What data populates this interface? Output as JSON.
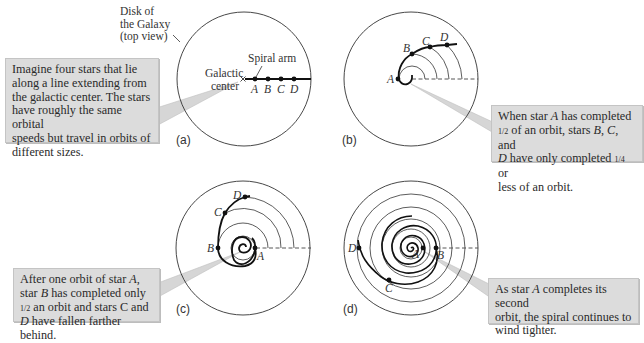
{
  "annotations": {
    "disk_label": [
      "Disk of",
      "the Galaxy",
      "(top view)"
    ],
    "spiral_arm": "Spiral arm",
    "galactic_center": [
      "Galactic",
      "center"
    ]
  },
  "panels": [
    {
      "id": "a",
      "label": "(a)",
      "stars": [
        "A",
        "B",
        "C",
        "D"
      ],
      "callout": {
        "lines": [
          "Imagine four stars that lie",
          "along a line extending from",
          "the galactic center. The stars",
          "have roughly the same orbital",
          "speeds but travel in orbits of",
          "different sizes."
        ]
      }
    },
    {
      "id": "b",
      "label": "(b)",
      "stars": [
        "A",
        "B",
        "C",
        "D"
      ],
      "callout": {
        "parts": {
          "l1_pre": "When star ",
          "l1_em": "A",
          "l1_post": " has completed",
          "l2_frac": "1/2",
          "l2_mid": " of an orbit, stars ",
          "l2_em1": "B",
          "l2_sep": ", ",
          "l2_em2": "C",
          "l2_post": ", and",
          "l3_em": "D",
          "l3_mid": " have only completed ",
          "l3_frac": "1/4",
          "l3_post": " or",
          "l4": "less of an orbit."
        }
      }
    },
    {
      "id": "c",
      "label": "(c)",
      "stars": [
        "A",
        "B",
        "C",
        "D"
      ],
      "callout": {
        "parts": {
          "l1_pre": "After one orbit of star ",
          "l1_em": "A",
          "l1_post": ",",
          "l2_pre": "star ",
          "l2_em": "B",
          "l2_post": " has completed only",
          "l3_frac": "1/2",
          "l3_post": " an orbit and stars C and",
          "l4_em": "D",
          "l4_post": " have fallen farther behind."
        }
      }
    },
    {
      "id": "d",
      "label": "(d)",
      "stars": [
        "A",
        "B",
        "C",
        "D"
      ],
      "callout": {
        "parts": {
          "l1_pre": "As star ",
          "l1_em": "A",
          "l1_post": " completes its second",
          "l2": "orbit, the spiral continues to",
          "l3": "wind tighter."
        }
      }
    }
  ],
  "colors": {
    "callout_bg": "#dcdcdc",
    "pointer": "#d6d6d6",
    "line": "#222222"
  }
}
